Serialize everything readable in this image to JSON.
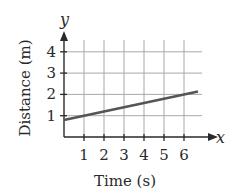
{
  "chart_data": {
    "type": "line",
    "title": "",
    "xlabel": "Time (s)",
    "ylabel": "Distance (m)",
    "x_axis_variable": "x",
    "y_axis_variable": "y",
    "x_ticks": [
      "1",
      "2",
      "3",
      "4",
      "5",
      "6"
    ],
    "y_ticks": [
      "1",
      "2",
      "3",
      "4"
    ],
    "xlim": [
      0,
      6.7
    ],
    "ylim": [
      0,
      4.5
    ],
    "grid": true,
    "legend": null,
    "series": [
      {
        "name": "distance",
        "x": [
          0,
          1,
          2,
          3,
          4,
          5,
          6,
          6.7
        ],
        "values": [
          0.8,
          1.0,
          1.2,
          1.4,
          1.6,
          1.8,
          2.0,
          2.14
        ]
      }
    ],
    "colors": {
      "line": "#555555",
      "grid": "#a8a8a8",
      "axis": "#2a2a2a"
    }
  },
  "labels": {
    "xlabel": "Time (s)",
    "ylabel": "Distance (m)",
    "xvar": "x",
    "yvar": "y",
    "xticks": [
      "1",
      "2",
      "3",
      "4",
      "5",
      "6"
    ],
    "yticks": [
      "1",
      "2",
      "3",
      "4"
    ]
  }
}
